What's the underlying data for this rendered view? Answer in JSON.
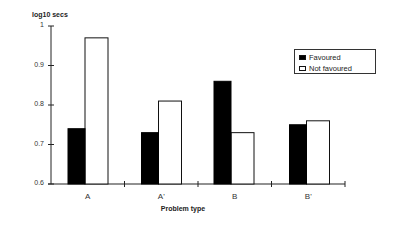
{
  "chart_data": {
    "type": "bar",
    "title": "",
    "xlabel": "Problem type",
    "ylabel": "log10 secs",
    "categories": [
      "A",
      "A'",
      "B",
      "B'"
    ],
    "series": [
      {
        "name": "Favoured",
        "color": "#000000",
        "values": [
          0.74,
          0.73,
          0.86,
          0.75
        ]
      },
      {
        "name": "Not favoured",
        "color": "#ffffff",
        "values": [
          0.97,
          0.81,
          0.73,
          0.76
        ]
      }
    ],
    "ylim": [
      0.6,
      1.0
    ],
    "yticks": [
      0.6,
      0.7,
      0.8,
      0.9,
      1.0
    ],
    "ytick_labels": [
      "0.6",
      "0.7",
      "0.8",
      "0.9",
      "1"
    ],
    "grid": false,
    "legend_position": "upper right"
  },
  "labels": {
    "ylabel": "log10 secs",
    "xlabel": "Problem type",
    "legend": [
      "Favoured",
      "Not favoured"
    ]
  }
}
